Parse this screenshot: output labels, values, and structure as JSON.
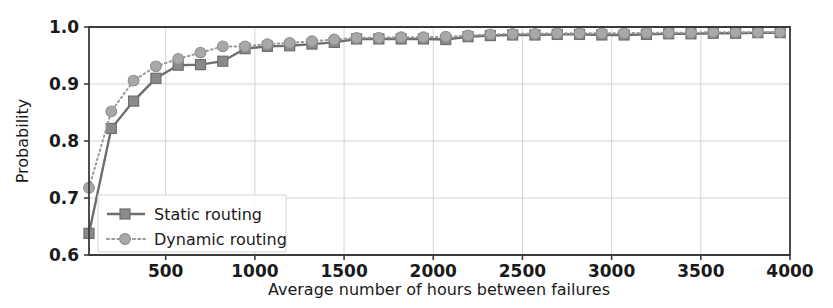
{
  "chart_data": {
    "type": "line",
    "title": "",
    "subtitle": "",
    "xlabel": "Average number of hours between failures",
    "ylabel": "Probability",
    "xlim": [
      70,
      4000
    ],
    "ylim": [
      0.6,
      1.0
    ],
    "xticks": [
      500,
      1000,
      1500,
      2000,
      2500,
      3000,
      3500,
      4000
    ],
    "xtick_labels": [
      "500",
      "1000",
      "1500",
      "2000",
      "2500",
      "3000",
      "3500",
      "4000"
    ],
    "yticks": [
      0.6,
      0.7,
      0.8,
      0.9,
      1.0
    ],
    "ytick_labels": [
      "0.6",
      "0.7",
      "0.8",
      "0.9",
      "1.0"
    ],
    "grid": true,
    "legend_position": "lower left",
    "x": [
      70,
      195,
      320,
      445,
      570,
      695,
      820,
      945,
      1070,
      1195,
      1320,
      1445,
      1570,
      1695,
      1820,
      1945,
      2070,
      2195,
      2320,
      2445,
      2570,
      2695,
      2820,
      2945,
      3070,
      3195,
      3320,
      3445,
      3570,
      3695,
      3820,
      3945
    ],
    "series": [
      {
        "name": "Static routing",
        "marker": "square",
        "linestyle": "solid",
        "color": "#6e6e6e",
        "values": [
          0.638,
          0.822,
          0.87,
          0.91,
          0.933,
          0.934,
          0.94,
          0.962,
          0.966,
          0.967,
          0.97,
          0.973,
          0.979,
          0.979,
          0.979,
          0.979,
          0.978,
          0.983,
          0.985,
          0.986,
          0.986,
          0.987,
          0.987,
          0.986,
          0.986,
          0.987,
          0.988,
          0.988,
          0.989,
          0.989,
          0.99,
          0.99
        ]
      },
      {
        "name": "Dynamic routing",
        "marker": "circle",
        "linestyle": "dotted",
        "color": "#9a9a9a",
        "values": [
          0.718,
          0.852,
          0.906,
          0.931,
          0.944,
          0.955,
          0.966,
          0.966,
          0.97,
          0.972,
          0.975,
          0.978,
          0.981,
          0.981,
          0.982,
          0.982,
          0.983,
          0.985,
          0.987,
          0.988,
          0.988,
          0.989,
          0.989,
          0.989,
          0.989,
          0.99,
          0.99,
          0.99,
          0.991,
          0.991,
          0.991,
          0.991
        ]
      }
    ]
  },
  "legend": {
    "entries": [
      {
        "label": "Static routing"
      },
      {
        "label": "Dynamic routing"
      }
    ]
  },
  "colors": {
    "static": "#6e6e6e",
    "dynamic": "#9a9a9a",
    "grid": "#cfcfcf",
    "axis": "#3b3b3b",
    "background": "#ffffff"
  }
}
